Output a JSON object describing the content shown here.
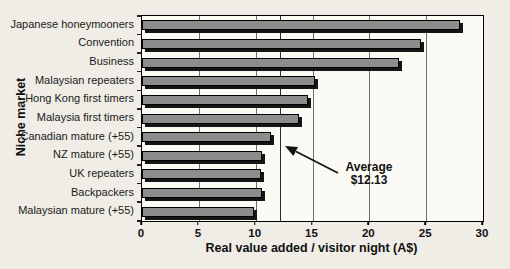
{
  "chart_data": {
    "type": "bar",
    "orientation": "horizontal",
    "title": "",
    "categories": [
      "Japanese honeymooners",
      "Convention",
      "Business",
      "Malaysian repeaters",
      "Hong Kong first timers",
      "Malaysia first timers",
      "Canadian mature (+55)",
      "NZ mature (+55)",
      "UK repeaters",
      "Backpackers",
      "Malaysian mature (+55)"
    ],
    "values": [
      27.8,
      24.4,
      22.4,
      15.0,
      14.4,
      13.6,
      11.2,
      10.4,
      10.3,
      10.4,
      9.7
    ],
    "xlabel": "Real value added / visitor night (A$)",
    "ylabel": "Niche market",
    "xlim": [
      0,
      30
    ],
    "x_ticks": [
      0,
      5,
      10,
      15,
      20,
      25,
      30
    ],
    "gridlines_at": [
      5,
      10,
      15,
      20,
      25
    ],
    "legend": "none",
    "annotation": {
      "line1": "Average",
      "line2": "$12.13",
      "value": 12.13
    }
  },
  "colors": {
    "page_bg": "#efede6",
    "plot_bg": "#fbfaf4",
    "bar_fill": "#8d8d8d",
    "bar_border": "#000000",
    "bar_shadow": "#151515",
    "gridline": "#6e6e6e",
    "average_line": "#2b2b2b",
    "text": "#111111"
  }
}
